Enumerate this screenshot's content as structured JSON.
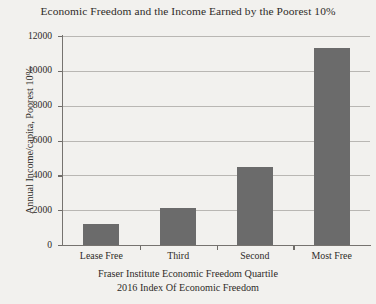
{
  "chart_data": {
    "type": "bar",
    "title": "Economic Freedom and the Income Earned by the Poorest 10%",
    "categories": [
      "Lease Free",
      "Third",
      "Second",
      "Most Free"
    ],
    "values": [
      1200,
      2100,
      4500,
      11300
    ],
    "series": [
      {
        "name": "Annual Income/capita, Poorest 10%",
        "values": [
          1200,
          2100,
          4500,
          11300
        ]
      }
    ],
    "xlabel": "Fraser Institute Economic Freedom Quartile",
    "xlabel_line2": "2016 Index Of Economic Freedom",
    "ylabel": "Annual Income/capita, Poorest 10%",
    "ylim": [
      0,
      12000
    ],
    "ytick_values": [
      0,
      2000,
      4000,
      6000,
      8000,
      10000,
      12000
    ],
    "ytick_labels": [
      "0",
      "2000",
      "4000",
      "6000",
      "8000",
      "10000",
      "12000"
    ],
    "grid": true,
    "legend": false,
    "bar_color": "#6b6b6b",
    "axis_color": "#76736f",
    "grid_color": "#b9b7b3",
    "background_color": "#f2f1ee",
    "text_color": "#2e2b28"
  }
}
